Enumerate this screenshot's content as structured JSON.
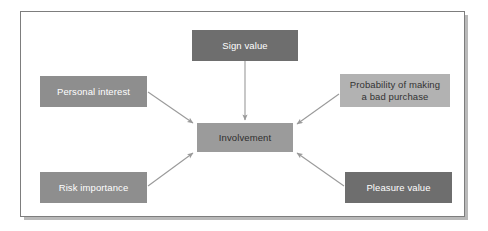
{
  "diagram": {
    "frame": {
      "border_color": "#7d7d7d",
      "background": "#ffffff",
      "shadow_color": "#b9b9b9"
    },
    "nodes": [
      {
        "id": "sign-value",
        "label": "Sign value",
        "fill": "#6e6e6e",
        "text_color": "#ffffff",
        "position": "top-center"
      },
      {
        "id": "personal-interest",
        "label": "Personal interest",
        "fill": "#8e8e8e",
        "text_color": "#ffffff",
        "position": "left-upper"
      },
      {
        "id": "probability-bad-purchase",
        "label": "Probability of making\na bad purchase",
        "fill": "#b2b2b2",
        "text_color": "#333333",
        "position": "right-upper"
      },
      {
        "id": "involvement",
        "label": "Involvement",
        "fill": "#9b9b9b",
        "text_color": "#2e2e2e",
        "position": "center"
      },
      {
        "id": "risk-importance",
        "label": "Risk importance",
        "fill": "#8e8e8e",
        "text_color": "#ffffff",
        "position": "left-lower"
      },
      {
        "id": "pleasure-value",
        "label": "Pleasure value",
        "fill": "#6e6e6e",
        "text_color": "#ffffff",
        "position": "right-lower"
      }
    ],
    "arrows": [
      {
        "id": "sign-value-to-involvement",
        "from": "sign-value",
        "to": "involvement",
        "color": "#9a9a9a"
      },
      {
        "id": "personal-interest-to-involvement",
        "from": "personal-interest",
        "to": "involvement",
        "color": "#9a9a9a"
      },
      {
        "id": "probability-to-involvement",
        "from": "probability-bad-purchase",
        "to": "involvement",
        "color": "#9a9a9a"
      },
      {
        "id": "risk-importance-to-involvement",
        "from": "risk-importance",
        "to": "involvement",
        "color": "#9a9a9a"
      },
      {
        "id": "pleasure-value-to-involvement",
        "from": "pleasure-value",
        "to": "involvement",
        "color": "#9a9a9a"
      }
    ]
  }
}
